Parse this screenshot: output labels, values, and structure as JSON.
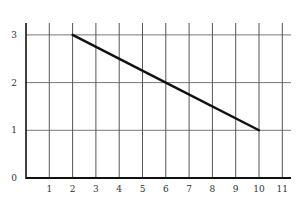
{
  "chart_data": {
    "type": "line",
    "title": "",
    "xlabel": "",
    "ylabel": "",
    "x_ticks": [
      1,
      2,
      3,
      4,
      5,
      6,
      7,
      8,
      9,
      10,
      11
    ],
    "y_ticks": [
      0,
      1,
      2,
      3
    ],
    "xlim": [
      0,
      11.4
    ],
    "ylim": [
      0,
      3.25
    ],
    "grid": true,
    "legend": null,
    "series": [
      {
        "name": "line",
        "x": [
          2,
          6,
          10
        ],
        "y": [
          3,
          2,
          1
        ],
        "color": "#111111"
      }
    ]
  },
  "style": {
    "grid_color": "#555555",
    "axis_color": "#111111",
    "line_color": "#111111"
  }
}
